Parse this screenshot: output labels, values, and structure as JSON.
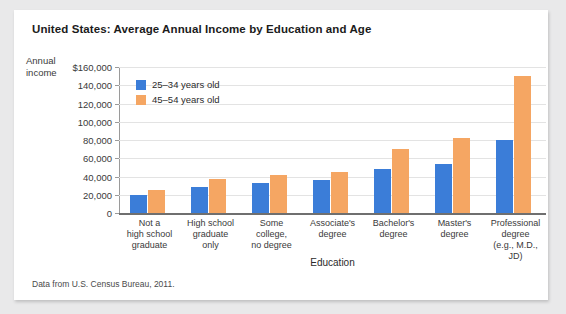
{
  "card": {
    "title": "United States: Average Annual Income by Education and Age",
    "source_note": "Data from U.S. Census Bureau, 2011."
  },
  "chart_data": {
    "type": "bar",
    "title": "United States: Average Annual Income by Education and Age",
    "xlabel": "Education",
    "ylabel": "Annual income",
    "ylim": [
      0,
      160000
    ],
    "ytick_labels": [
      "$160,000",
      "140,000",
      "120,000",
      "100,000",
      "80,000",
      "60,000",
      "40,000",
      "20,000",
      "0"
    ],
    "ytick_values": [
      160000,
      140000,
      120000,
      100000,
      80000,
      60000,
      40000,
      20000,
      0
    ],
    "grid": true,
    "legend_position": "upper-left-inside",
    "categories": [
      "Not a\nhigh school\ngraduate",
      "High school\ngraduate\nonly",
      "Some\ncollege,\nno degree",
      "Associate's\ndegree",
      "Bachelor's\ndegree",
      "Master's\ndegree",
      "Professional\ndegree\n(e.g., M.D., JD)"
    ],
    "category_lines": [
      [
        "Not a",
        "high school",
        "graduate"
      ],
      [
        "High school",
        "graduate",
        "only"
      ],
      [
        "Some",
        "college,",
        "no degree"
      ],
      [
        "Associate's",
        "degree"
      ],
      [
        "Bachelor's",
        "degree"
      ],
      [
        "Master's",
        "degree"
      ],
      [
        "Professional",
        "degree",
        "(e.g., M.D., JD)"
      ]
    ],
    "series": [
      {
        "name": "25–34 years old",
        "color": "#3b7dd8",
        "values": [
          20000,
          28000,
          33000,
          36000,
          48000,
          54000,
          80000
        ]
      },
      {
        "name": "45–54 years old",
        "color": "#f5a663",
        "values": [
          25000,
          37000,
          42000,
          45000,
          70000,
          82000,
          150000
        ]
      }
    ]
  }
}
